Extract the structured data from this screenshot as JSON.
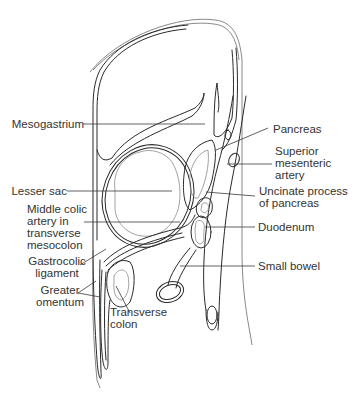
{
  "diagram": {
    "line_color": "#2a2a2a",
    "text_color": "#333333",
    "labels": {
      "mesogastrium": "Mesogastrium",
      "pancreas": "Pancreas",
      "superior_mesenteric_artery": "Superior\nmesenteric\nartery",
      "lesser_sac": "Lesser sac",
      "uncinate_process": "Uncinate process\nof pancreas",
      "middle_colic_artery": "Middle colic\nartery in\ntransverse\nmesocolon",
      "duodenum": "Duodenum",
      "gastrocolic_ligament": "Gastrocolic\nligament",
      "small_bowel": "Small bowel",
      "greater_omentum": "Greater\nomentum",
      "transverse_colon": "Transverse\ncolon"
    }
  }
}
